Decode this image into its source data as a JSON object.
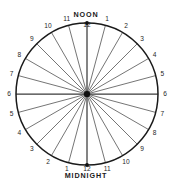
{
  "diagram": {
    "type": "24-hour-clock-face",
    "title_top": "NOON",
    "title_bottom": "MIDNIGHT",
    "center": {
      "x": 87,
      "y": 94
    },
    "radius": 71,
    "spoke_count": 24,
    "colors": {
      "background": "#ffffff",
      "rim": "#1a1a1a",
      "spoke": "#3a3a3a",
      "hub": "#111111",
      "text": "#1f1f1f"
    },
    "hours": [
      {
        "label": "12",
        "angle": 0,
        "position": "top"
      },
      {
        "label": "1",
        "angle": 15,
        "position": "upper-right"
      },
      {
        "label": "2",
        "angle": 30,
        "position": "upper-right"
      },
      {
        "label": "3",
        "angle": 45,
        "position": "upper-right"
      },
      {
        "label": "4",
        "angle": 60,
        "position": "upper-right"
      },
      {
        "label": "5",
        "angle": 75,
        "position": "upper-right"
      },
      {
        "label": "6",
        "angle": 90,
        "position": "right"
      },
      {
        "label": "7",
        "angle": 105,
        "position": "lower-right"
      },
      {
        "label": "8",
        "angle": 120,
        "position": "lower-right"
      },
      {
        "label": "9",
        "angle": 135,
        "position": "lower-right"
      },
      {
        "label": "10",
        "angle": 150,
        "position": "lower-right"
      },
      {
        "label": "11",
        "angle": 165,
        "position": "lower-right"
      },
      {
        "label": "12",
        "angle": 180,
        "position": "bottom"
      },
      {
        "label": "1",
        "angle": 195,
        "position": "lower-left"
      },
      {
        "label": "2",
        "angle": 210,
        "position": "lower-left"
      },
      {
        "label": "3",
        "angle": 225,
        "position": "lower-left"
      },
      {
        "label": "4",
        "angle": 240,
        "position": "lower-left"
      },
      {
        "label": "5",
        "angle": 255,
        "position": "lower-left"
      },
      {
        "label": "6",
        "angle": 270,
        "position": "left"
      },
      {
        "label": "7",
        "angle": 285,
        "position": "upper-left"
      },
      {
        "label": "8",
        "angle": 300,
        "position": "upper-left"
      },
      {
        "label": "9",
        "angle": 315,
        "position": "upper-left"
      },
      {
        "label": "10",
        "angle": 330,
        "position": "upper-left"
      },
      {
        "label": "11",
        "angle": 345,
        "position": "upper-left"
      }
    ]
  }
}
